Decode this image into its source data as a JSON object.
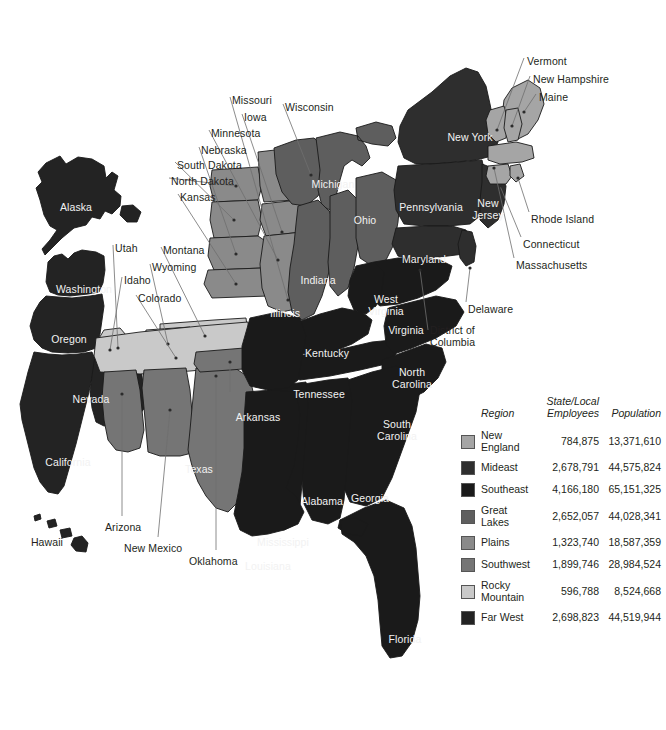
{
  "map": {
    "title": "United States regional map",
    "background_color": "#ffffff",
    "region_colors": {
      "new_england": "#a5a5a5",
      "mideast": "#2e2e2e",
      "southeast": "#1a1a1a",
      "great_lakes": "#5e5e5e",
      "plains": "#8a8a8a",
      "southwest": "#757575",
      "rocky_mountain": "#c9c9c9",
      "far_west": "#232323"
    },
    "inside_labels": [
      {
        "name": "Alaska",
        "text": "Alaska",
        "x": 76,
        "y": 202,
        "align": "center",
        "tone": "inside"
      },
      {
        "name": "Hawaii",
        "text": "Hawaii",
        "x": 47,
        "y": 537,
        "align": "center",
        "tone": "outside"
      },
      {
        "name": "Washington",
        "text": "Washington",
        "x": 84,
        "y": 284,
        "align": "center",
        "tone": "inside"
      },
      {
        "name": "Oregon",
        "text": "Oregon",
        "x": 69,
        "y": 334,
        "align": "center",
        "tone": "inside"
      },
      {
        "name": "Nevada",
        "text": "Nevada",
        "x": 91,
        "y": 394,
        "align": "center",
        "tone": "inside"
      },
      {
        "name": "California",
        "text": "California",
        "x": 68,
        "y": 457,
        "align": "center",
        "tone": "inside"
      },
      {
        "name": "Texas",
        "text": "Texas",
        "x": 199,
        "y": 464,
        "align": "center",
        "tone": "inside"
      },
      {
        "name": "Arkansas",
        "text": "Arkansas",
        "x": 258,
        "y": 412,
        "align": "center",
        "tone": "inside"
      },
      {
        "name": "Louisiana",
        "text": "Louisiana",
        "x": 268,
        "y": 561,
        "align": "center",
        "tone": "inside"
      },
      {
        "name": "Mississippi",
        "text": "Mississippi",
        "x": 283,
        "y": 537,
        "align": "center",
        "tone": "inside"
      },
      {
        "name": "Alabama",
        "text": "Alabama",
        "x": 322,
        "y": 496,
        "align": "center",
        "tone": "inside"
      },
      {
        "name": "Georgia",
        "text": "Georgia",
        "x": 370,
        "y": 493,
        "align": "center",
        "tone": "inside"
      },
      {
        "name": "Florida",
        "text": "Florida",
        "x": 405,
        "y": 634,
        "align": "center",
        "tone": "inside"
      },
      {
        "name": "SouthCarolina",
        "text": "South\nCarolina",
        "x": 397,
        "y": 419,
        "align": "center",
        "tone": "inside"
      },
      {
        "name": "NorthCarolina",
        "text": "North\nCarolina",
        "x": 412,
        "y": 367,
        "align": "center",
        "tone": "inside"
      },
      {
        "name": "Tennessee",
        "text": "Tennessee",
        "x": 319,
        "y": 389,
        "align": "center",
        "tone": "inside"
      },
      {
        "name": "Kentucky",
        "text": "Kentucky",
        "x": 327,
        "y": 348,
        "align": "center",
        "tone": "inside"
      },
      {
        "name": "Virginia",
        "text": "Virginia",
        "x": 406,
        "y": 325,
        "align": "center",
        "tone": "inside"
      },
      {
        "name": "WestVirginia",
        "text": "West\nVirginia",
        "x": 386,
        "y": 294,
        "align": "center",
        "tone": "inside"
      },
      {
        "name": "Maryland",
        "text": "Maryland",
        "x": 424,
        "y": 254,
        "align": "center",
        "tone": "inside"
      },
      {
        "name": "Illinois",
        "text": "Illinois",
        "x": 285,
        "y": 308,
        "align": "center",
        "tone": "inside"
      },
      {
        "name": "Indiana",
        "text": "Indiana",
        "x": 318,
        "y": 275,
        "align": "center",
        "tone": "inside"
      },
      {
        "name": "Ohio",
        "text": "Ohio",
        "x": 365,
        "y": 215,
        "align": "center",
        "tone": "inside"
      },
      {
        "name": "Michigan",
        "text": "Michigan",
        "x": 333,
        "y": 179,
        "align": "center",
        "tone": "inside"
      },
      {
        "name": "Pennsylvania",
        "text": "Pennsylvania",
        "x": 431,
        "y": 202,
        "align": "center",
        "tone": "inside"
      },
      {
        "name": "NewYork",
        "text": "New York",
        "x": 470,
        "y": 132,
        "align": "center",
        "tone": "inside"
      },
      {
        "name": "NewJersey",
        "text": "New\nJersey",
        "x": 488,
        "y": 198,
        "align": "center",
        "tone": "inside"
      }
    ],
    "leader_labels": [
      {
        "name": "Vermont",
        "text": "Vermont",
        "x": 527,
        "y": 56,
        "align": "left"
      },
      {
        "name": "NewHampshire",
        "text": "New Hampshire",
        "x": 533,
        "y": 74,
        "align": "left"
      },
      {
        "name": "Maine",
        "text": "Maine",
        "x": 539,
        "y": 92,
        "align": "left"
      },
      {
        "name": "RhodeIsland",
        "text": "Rhode Island",
        "x": 531,
        "y": 214,
        "align": "left"
      },
      {
        "name": "Connecticut",
        "text": "Connecticut",
        "x": 523,
        "y": 239,
        "align": "left"
      },
      {
        "name": "Massachusetts",
        "text": "Massachusetts",
        "x": 516,
        "y": 260,
        "align": "left"
      },
      {
        "name": "Delaware",
        "text": "Delaware",
        "x": 468,
        "y": 304,
        "align": "left"
      },
      {
        "name": "DistrictOfColumbia",
        "text": "District of\nColumbia",
        "x": 430,
        "y": 325,
        "align": "left"
      },
      {
        "name": "Missouri",
        "text": "Missouri",
        "x": 232,
        "y": 95,
        "align": "left"
      },
      {
        "name": "Iowa",
        "text": "Iowa",
        "x": 244,
        "y": 112,
        "align": "left"
      },
      {
        "name": "Wisconsin",
        "text": "Wisconsin",
        "x": 285,
        "y": 102,
        "align": "left"
      },
      {
        "name": "Minnesota",
        "text": "Minnesota",
        "x": 211,
        "y": 128,
        "align": "left"
      },
      {
        "name": "Nebraska",
        "text": "Nebraska",
        "x": 201,
        "y": 145,
        "align": "left"
      },
      {
        "name": "SouthDakota",
        "text": "South Dakota",
        "x": 177,
        "y": 160,
        "align": "left"
      },
      {
        "name": "NorthDakota",
        "text": "North Dakota",
        "x": 171,
        "y": 176,
        "align": "left"
      },
      {
        "name": "Kansas",
        "text": "Kansas",
        "x": 180,
        "y": 192,
        "align": "left"
      },
      {
        "name": "Utah",
        "text": "Utah",
        "x": 115,
        "y": 243,
        "align": "left"
      },
      {
        "name": "Montana",
        "text": "Montana",
        "x": 163,
        "y": 245,
        "align": "left"
      },
      {
        "name": "Wyoming",
        "text": "Wyoming",
        "x": 152,
        "y": 262,
        "align": "left"
      },
      {
        "name": "Idaho",
        "text": "Idaho",
        "x": 124,
        "y": 275,
        "align": "left"
      },
      {
        "name": "Colorado",
        "text": "Colorado",
        "x": 138,
        "y": 293,
        "align": "left"
      },
      {
        "name": "Arizona",
        "text": "Arizona",
        "x": 105,
        "y": 522,
        "align": "left"
      },
      {
        "name": "NewMexico",
        "text": "New Mexico",
        "x": 124,
        "y": 543,
        "align": "left"
      },
      {
        "name": "Oklahoma",
        "text": "Oklahoma",
        "x": 189,
        "y": 556,
        "align": "left"
      }
    ]
  },
  "legend": {
    "headers": {
      "region": "Region",
      "employees": "State/Local\nEmployees",
      "population": "Population"
    },
    "rows": [
      {
        "region": "New\nEngland",
        "color": "#a5a5a5",
        "employees": "784,875",
        "population": "13,371,610"
      },
      {
        "region": "Mideast",
        "color": "#2e2e2e",
        "employees": "2,678,791",
        "population": "44,575,824"
      },
      {
        "region": "Southeast",
        "color": "#1a1a1a",
        "employees": "4,166,180",
        "population": "65,151,325"
      },
      {
        "region": "Great\nLakes",
        "color": "#5e5e5e",
        "employees": "2,652,057",
        "population": "44,028,341"
      },
      {
        "region": "Plains",
        "color": "#8a8a8a",
        "employees": "1,323,740",
        "population": "18,587,359"
      },
      {
        "region": "Southwest",
        "color": "#757575",
        "employees": "1,899,746",
        "population": "28,984,524"
      },
      {
        "region": "Rocky\nMountain",
        "color": "#c9c9c9",
        "employees": "596,788",
        "population": "8,524,668"
      },
      {
        "region": "Far West",
        "color": "#232323",
        "employees": "2,698,823",
        "population": "44,519,944"
      }
    ]
  }
}
